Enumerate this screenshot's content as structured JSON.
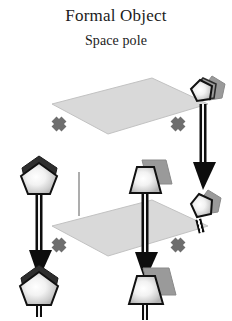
{
  "figure": {
    "title": "Formal Object",
    "subtitle": "Space pole",
    "background_color": "#ffffff",
    "text_color": "#1b1b1b"
  },
  "palette": {
    "plane_fill": "#d9d9d9",
    "plane_edge": "#b3b3b3",
    "node_outline": "#111111",
    "node_highlight": "#ffffff",
    "node_body": "#c9c9c9",
    "node_shadow_dark": "#2e2e2e",
    "node_extrude_gray": "#9a9a9a",
    "cross_color": "#6e6e6e",
    "arrow_color": "#0d0d0d",
    "thin_line": "#8a8a8a"
  },
  "planes": [
    {
      "name": "top-plane",
      "label": "upper space plane",
      "points": "52,104 152,78 208,104 108,134",
      "fill": "#d9d9d9",
      "stroke": "#c2c2c2"
    },
    {
      "name": "bottom-plane",
      "label": "lower space plane",
      "points": "52,226 152,200 208,226 108,256",
      "fill": "#d9d9d9",
      "stroke": "#c2c2c2"
    }
  ],
  "nodes": [
    {
      "id": "node-top-right",
      "label": "top-right pole node",
      "shape": "pentagon",
      "cx": 203,
      "cy": 92,
      "r": 17,
      "rotation": 38,
      "extrude_dx": 9,
      "extrude_dy": -9,
      "extrude_color": "#9a9a9a"
    },
    {
      "id": "node-top-left",
      "label": "top-left pole node",
      "shape": "pentagon",
      "cx": 39,
      "cy": 178,
      "r": 18,
      "rotation": 0,
      "extrude_dx": 3,
      "extrude_dy": -11,
      "extrude_color": "#2e2e2e"
    },
    {
      "id": "node-top-mid",
      "label": "top-middle pole node",
      "shape": "trapezoid",
      "cx": 145,
      "cy": 180,
      "r": 17,
      "rotation": 0,
      "extrude_dx": 9,
      "extrude_dy": -8,
      "extrude_color": "#9a9a9a"
    },
    {
      "id": "node-mid-right",
      "label": "right-middle pole node",
      "shape": "pentagon",
      "cx": 200,
      "cy": 207,
      "r": 16,
      "rotation": 20,
      "extrude_dx": 7,
      "extrude_dy": -7,
      "extrude_color": "#9a9a9a"
    },
    {
      "id": "node-bottom-left",
      "label": "bottom-left pole node",
      "shape": "pentagon",
      "cx": 39,
      "cy": 288,
      "r": 19,
      "rotation": 0,
      "extrude_dx": 4,
      "extrude_dy": -12,
      "extrude_color": "#2e2e2e"
    },
    {
      "id": "node-bottom-mid",
      "label": "bottom-middle pole node",
      "shape": "trapezoid",
      "cx": 145,
      "cy": 291,
      "r": 18,
      "rotation": 0,
      "extrude_dx": 10,
      "extrude_dy": -9,
      "extrude_color": "#9a9a9a"
    }
  ],
  "stems": [
    {
      "id": "stem-top-left",
      "label": "stem of top-left node",
      "x": 39,
      "y1": 193,
      "y2": 226
    },
    {
      "id": "stem-top-mid",
      "label": "stem of top-middle node",
      "x": 145,
      "y1": 194,
      "y2": 232
    },
    {
      "id": "stem-top-right",
      "label": "stem of top-right node",
      "x": 203,
      "y1": 108,
      "y2": 128
    },
    {
      "id": "stem-bottom-mid",
      "label": "stem of bottom-mid node",
      "x": 145,
      "y1": 305,
      "y2": 318
    }
  ],
  "arrows": [
    {
      "id": "arrow-left",
      "label": "downward pole arrow, left",
      "x": 39,
      "y_start": 196,
      "y_end": 278,
      "shaft_width": 7,
      "head_width": 20,
      "head_length": 26
    },
    {
      "id": "arrow-middle",
      "label": "downward pole arrow, middle",
      "x": 145,
      "y_start": 198,
      "y_end": 281,
      "shaft_width": 7,
      "head_width": 20,
      "head_length": 26
    },
    {
      "id": "arrow-right",
      "label": "downward pole arrow, right",
      "x": 203,
      "y_start": 106,
      "y_end": 188,
      "shaft_width": 7,
      "head_width": 20,
      "head_length": 26
    }
  ],
  "crosses": [
    {
      "id": "cross-top-left",
      "label": "x mark on upper-left edge",
      "cx": 59,
      "cy": 124,
      "size": 11,
      "thickness": 7,
      "rotation": 45
    },
    {
      "id": "cross-top-right",
      "label": "x mark on upper-right edge",
      "cx": 178,
      "cy": 124,
      "size": 11,
      "thickness": 7,
      "rotation": 45
    },
    {
      "id": "cross-bottom-left",
      "label": "x mark on lower-left edge",
      "cx": 59,
      "cy": 245,
      "size": 11,
      "thickness": 7,
      "rotation": 45
    },
    {
      "id": "cross-bottom-right",
      "label": "x mark on lower-right edge",
      "cx": 178,
      "cy": 245,
      "size": 11,
      "thickness": 7,
      "rotation": 45
    }
  ],
  "connectors": [
    {
      "id": "connector-back-vertical",
      "label": "thin vertical line joining rear plane corners",
      "x": 79,
      "y1": 172,
      "y2": 216,
      "color": "#8a8a8a",
      "width": 1.4
    }
  ]
}
